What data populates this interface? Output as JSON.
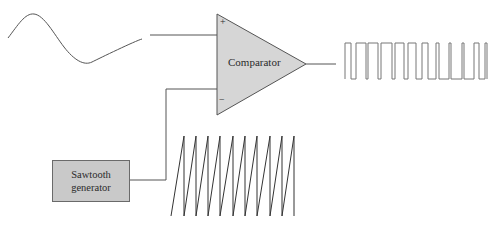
{
  "diagram": {
    "title": "",
    "comparator": {
      "label": "Comparator",
      "plus_input": "+",
      "minus_input": "−"
    },
    "sawtooth_generator": {
      "line1": "Sawtooth",
      "line2": "generator"
    },
    "signals": {
      "input_sine": "sine-wave-input",
      "sawtooth": "sawtooth-wave",
      "output": "pwm-square-wave-output"
    },
    "colors": {
      "block_fill": "#d6d6d6",
      "box_fill": "#c9c9c9",
      "stroke": "#555555"
    }
  }
}
